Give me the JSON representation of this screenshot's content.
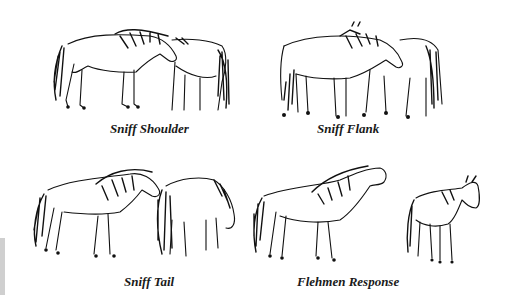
{
  "figure": {
    "panels": [
      {
        "id": "sniff-shoulder",
        "caption": "Sniff Shoulder",
        "illustration": "two-horses-sniffing-shoulder"
      },
      {
        "id": "sniff-flank",
        "caption": "Sniff Flank",
        "illustration": "two-horses-sniffing-flank"
      },
      {
        "id": "sniff-tail",
        "caption": "Sniff Tail",
        "illustration": "horse-sniffing-tail-of-grazing-horse"
      },
      {
        "id": "flehmen-response",
        "caption": "Flehmen Response",
        "illustration": "horse-flehmen-lip-curl-and-mare"
      }
    ],
    "colors": {
      "background": "#ffffff",
      "ink": "#111111",
      "side_bar": "#cfcfcf"
    }
  }
}
